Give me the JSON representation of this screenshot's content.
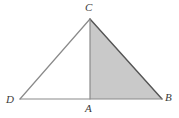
{
  "figure": {
    "canvas": {
      "width": 179,
      "height": 118,
      "background": "#ffffff"
    },
    "colors": {
      "shaded_fill": "#c9c9c9",
      "outline_dark": "#555555",
      "outline_light": "#8a8a8a",
      "label_color": "#3a3a3a"
    },
    "points": {
      "C": {
        "label": "C",
        "x": 90,
        "y": 19
      },
      "D": {
        "label": "D",
        "x": 20,
        "y": 99
      },
      "A": {
        "label": "A",
        "x": 90,
        "y": 99
      },
      "B": {
        "label": "B",
        "x": 162,
        "y": 99
      }
    },
    "segments": [
      {
        "name": "DC",
        "from": "D",
        "to": "C",
        "stroke": "#8a8a8a",
        "width": 1.2
      },
      {
        "name": "CB",
        "from": "C",
        "to": "B",
        "stroke": "#555555",
        "width": 1.4
      },
      {
        "name": "DB",
        "from": "D",
        "to": "B",
        "stroke": "#8a8a8a",
        "width": 1.2
      },
      {
        "name": "CA",
        "from": "C",
        "to": "A",
        "stroke": "#8a8a8a",
        "width": 1.2
      }
    ],
    "shaded_region": {
      "name": "triangle-CAB",
      "vertices": [
        "C",
        "A",
        "B"
      ],
      "fill": "#c9c9c9"
    }
  }
}
